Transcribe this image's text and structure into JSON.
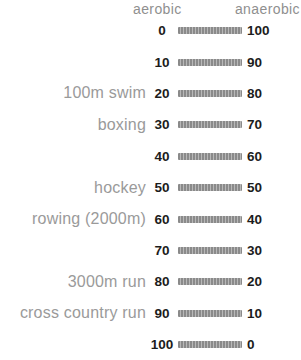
{
  "header": {
    "aerobic": "aerobic",
    "anaerobic": "anaerobic"
  },
  "rows": [
    {
      "label": "",
      "aerobic": "0",
      "anaerobic": "100"
    },
    {
      "label": "",
      "aerobic": "10",
      "anaerobic": "90"
    },
    {
      "label": "100m swim",
      "aerobic": "20",
      "anaerobic": "80"
    },
    {
      "label": "boxing",
      "aerobic": "30",
      "anaerobic": "70"
    },
    {
      "label": "",
      "aerobic": "40",
      "anaerobic": "60"
    },
    {
      "label": "hockey",
      "aerobic": "50",
      "anaerobic": "50"
    },
    {
      "label": "rowing (2000m)",
      "aerobic": "60",
      "anaerobic": "40"
    },
    {
      "label": "",
      "aerobic": "70",
      "anaerobic": "30"
    },
    {
      "label": "3000m run",
      "aerobic": "80",
      "anaerobic": "20"
    },
    {
      "label": "cross country run",
      "aerobic": "90",
      "anaerobic": "10"
    },
    {
      "label": "",
      "aerobic": "100",
      "anaerobic": "0"
    }
  ],
  "colors": {
    "background": "#ffffff",
    "header_text": "#8f8f8f",
    "label_text": "#9a9a9a",
    "value_text": "#1c1c1c",
    "bar_dark": "#8a8a8a",
    "bar_light": "#b8b8b8"
  },
  "chart_data": {
    "type": "table",
    "columns": [
      "aerobic_percent",
      "anaerobic_percent",
      "sport"
    ],
    "axis": {
      "aerobic_range": [
        0,
        100
      ],
      "anaerobic_range": [
        100,
        0
      ],
      "step": 10
    },
    "scale_rows": [
      {
        "aerobic": 0,
        "anaerobic": 100,
        "sport": ""
      },
      {
        "aerobic": 10,
        "anaerobic": 90,
        "sport": ""
      },
      {
        "aerobic": 20,
        "anaerobic": 80,
        "sport": "100m swim"
      },
      {
        "aerobic": 30,
        "anaerobic": 70,
        "sport": "boxing"
      },
      {
        "aerobic": 40,
        "anaerobic": 60,
        "sport": ""
      },
      {
        "aerobic": 50,
        "anaerobic": 50,
        "sport": "hockey"
      },
      {
        "aerobic": 60,
        "anaerobic": 40,
        "sport": "rowing (2000m)"
      },
      {
        "aerobic": 70,
        "anaerobic": 30,
        "sport": ""
      },
      {
        "aerobic": 80,
        "anaerobic": 20,
        "sport": "3000m run"
      },
      {
        "aerobic": 90,
        "anaerobic": 10,
        "sport": "cross country run"
      },
      {
        "aerobic": 100,
        "anaerobic": 0,
        "sport": ""
      }
    ],
    "sports": [
      {
        "name": "100m swim",
        "aerobic": 20,
        "anaerobic": 80
      },
      {
        "name": "boxing",
        "aerobic": 30,
        "anaerobic": 70
      },
      {
        "name": "hockey",
        "aerobic": 50,
        "anaerobic": 50
      },
      {
        "name": "rowing (2000m)",
        "aerobic": 60,
        "anaerobic": 40
      },
      {
        "name": "3000m run",
        "aerobic": 80,
        "anaerobic": 20
      },
      {
        "name": "cross country run",
        "aerobic": 90,
        "anaerobic": 10
      }
    ]
  }
}
